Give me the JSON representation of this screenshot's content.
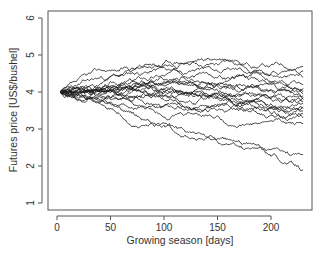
{
  "chart_data": {
    "type": "line",
    "title": "",
    "xlabel": "Growing season [days]",
    "ylabel": "Futures price [US$/bushel]",
    "xlim": [
      0,
      230
    ],
    "ylim": [
      1,
      6
    ],
    "x_ticks": [
      0,
      50,
      100,
      150,
      200
    ],
    "y_ticks": [
      1,
      2,
      3,
      4,
      5,
      6
    ],
    "grid": false,
    "legend": null,
    "x_start": 3,
    "x_end": 230,
    "start_value": 4.0,
    "series_description": "Approximately 20 simulated futures price paths (random walks) starting at ~4.0 US$/bushel, fanning out over the growing season",
    "series": [
      {
        "name": "path-1",
        "end": 4.7,
        "max": 5.05,
        "seed": 11
      },
      {
        "name": "path-2",
        "end": 4.55,
        "max": 4.65,
        "seed": 23
      },
      {
        "name": "path-3",
        "end": 4.4,
        "max": 4.6,
        "seed": 37
      },
      {
        "name": "path-4",
        "end": 4.2,
        "max": 4.5,
        "seed": 41
      },
      {
        "name": "path-5",
        "end": 4.1,
        "max": 4.4,
        "seed": 53
      },
      {
        "name": "path-6",
        "end": 4.0,
        "max": 4.35,
        "seed": 67
      },
      {
        "name": "path-7",
        "end": 3.95,
        "max": 4.3,
        "seed": 71
      },
      {
        "name": "path-8",
        "end": 3.9,
        "max": 4.3,
        "seed": 83
      },
      {
        "name": "path-9",
        "end": 3.85,
        "max": 4.25,
        "seed": 97
      },
      {
        "name": "path-10",
        "end": 3.8,
        "max": 4.2,
        "seed": 101
      },
      {
        "name": "path-11",
        "end": 3.75,
        "max": 4.2,
        "seed": 113
      },
      {
        "name": "path-12",
        "end": 3.7,
        "max": 4.15,
        "seed": 127
      },
      {
        "name": "path-13",
        "end": 3.6,
        "max": 4.1,
        "seed": 131
      },
      {
        "name": "path-14",
        "end": 3.55,
        "max": 4.1,
        "seed": 149
      },
      {
        "name": "path-15",
        "end": 3.5,
        "max": 4.05,
        "seed": 151
      },
      {
        "name": "path-16",
        "end": 3.4,
        "max": 4.05,
        "seed": 163
      },
      {
        "name": "path-17",
        "end": 3.3,
        "max": 4.0,
        "seed": 173
      },
      {
        "name": "path-18",
        "end": 3.15,
        "max": 4.0,
        "seed": 181
      },
      {
        "name": "path-19",
        "end": 2.3,
        "max": 4.0,
        "seed": 191
      },
      {
        "name": "path-20",
        "end": 1.9,
        "max": 4.0,
        "seed": 199
      }
    ],
    "colors": {
      "lines": "#1a1a1a",
      "axes": "#555555",
      "text": "#333333"
    }
  }
}
